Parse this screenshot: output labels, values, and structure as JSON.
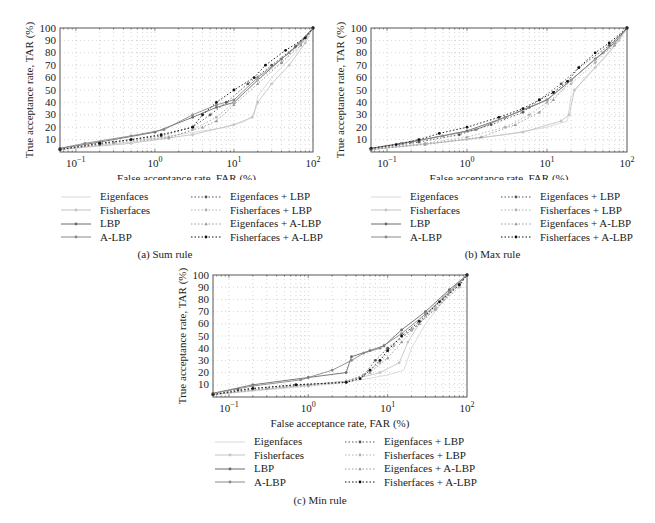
{
  "chart_data": [
    {
      "type": "line",
      "title": "(a) Sum rule",
      "xlabel": "False acceptance rate, FAR (%)",
      "ylabel": "True acceptance rate, TAR (%)",
      "xscale": "log",
      "xlim": [
        0.063,
        100
      ],
      "ylim": [
        0,
        100
      ],
      "xticks": [
        "10^-1",
        "10^0",
        "10^1",
        "10^2"
      ],
      "yticks": [
        10,
        20,
        30,
        40,
        50,
        60,
        70,
        80,
        90,
        100
      ],
      "grid": true,
      "legend_position": "below",
      "series": [
        {
          "name": "Eigenfaces",
          "x": [
            0.063,
            0.5,
            2,
            8,
            14,
            18,
            20,
            30,
            60,
            100
          ],
          "y": [
            2,
            8,
            14,
            20,
            25,
            30,
            45,
            60,
            80,
            100
          ]
        },
        {
          "name": "Fisherfaces",
          "x": [
            0.063,
            0.5,
            3,
            10,
            17,
            20,
            30,
            50,
            80,
            100
          ],
          "y": [
            2,
            7,
            14,
            22,
            28,
            40,
            55,
            70,
            88,
            100
          ]
        },
        {
          "name": "LBP",
          "x": [
            0.063,
            0.2,
            1,
            3,
            6,
            10,
            20,
            40,
            70,
            100
          ],
          "y": [
            3,
            8,
            16,
            28,
            36,
            40,
            58,
            75,
            88,
            100
          ]
        },
        {
          "name": "A-LBP",
          "x": [
            0.063,
            0.13,
            0.5,
            1.3,
            3,
            6,
            10,
            20,
            50,
            100
          ],
          "y": [
            3,
            7,
            13,
            18,
            30,
            38,
            42,
            60,
            80,
            100
          ]
        },
        {
          "name": "Eigenfaces + LBP",
          "x": [
            0.063,
            0.2,
            0.5,
            1.2,
            3,
            5,
            8,
            15,
            30,
            60,
            100
          ],
          "y": [
            2,
            6,
            10,
            13,
            20,
            30,
            40,
            55,
            70,
            85,
            100
          ]
        },
        {
          "name": "Fisherfaces + LBP",
          "x": [
            0.063,
            0.3,
            1.5,
            3,
            6,
            10,
            20,
            40,
            70,
            100
          ],
          "y": [
            2,
            7,
            11,
            18,
            28,
            40,
            58,
            72,
            88,
            100
          ]
        },
        {
          "name": "Eigenfaces + A-LBP",
          "x": [
            0.063,
            0.3,
            1.5,
            4,
            6,
            10,
            20,
            40,
            70,
            100
          ],
          "y": [
            2,
            8,
            12,
            20,
            25,
            38,
            55,
            72,
            86,
            100
          ]
        },
        {
          "name": "Fisherfaces + A-LBP",
          "x": [
            0.063,
            0.2,
            0.5,
            1.2,
            3,
            4,
            6,
            10,
            18,
            25,
            45,
            80,
            100
          ],
          "y": [
            2,
            7,
            10,
            14,
            20,
            30,
            40,
            50,
            60,
            70,
            82,
            92,
            100
          ]
        }
      ]
    },
    {
      "type": "line",
      "title": "(b) Max rule",
      "xlabel": "False acceptance rate, FAR (%)",
      "ylabel": "True acceptance rate, TAR (%)",
      "xscale": "log",
      "xlim": [
        0.063,
        100
      ],
      "ylim": [
        0,
        100
      ],
      "xticks": [
        "10^-1",
        "10^0",
        "10^1",
        "10^2"
      ],
      "yticks": [
        10,
        20,
        30,
        40,
        50,
        60,
        70,
        80,
        90,
        100
      ],
      "grid": true,
      "legend_position": "below",
      "series": [
        {
          "name": "Eigenfaces",
          "x": [
            0.063,
            0.5,
            3,
            10,
            18,
            20,
            30,
            60,
            100
          ],
          "y": [
            2,
            8,
            14,
            20,
            25,
            45,
            60,
            80,
            100
          ]
        },
        {
          "name": "Fisherfaces",
          "x": [
            0.063,
            1,
            5,
            15,
            19,
            22,
            40,
            80,
            100
          ],
          "y": [
            2,
            10,
            16,
            25,
            30,
            50,
            68,
            90,
            100
          ]
        },
        {
          "name": "LBP",
          "x": [
            0.063,
            0.2,
            1,
            3,
            6,
            10,
            20,
            40,
            70,
            100
          ],
          "y": [
            3,
            8,
            17,
            28,
            36,
            42,
            58,
            75,
            88,
            100
          ]
        },
        {
          "name": "A-LBP",
          "x": [
            0.063,
            0.15,
            0.5,
            1.3,
            3,
            6,
            10,
            20,
            50,
            100
          ],
          "y": [
            3,
            7,
            13,
            18,
            28,
            36,
            42,
            58,
            80,
            100
          ]
        },
        {
          "name": "Eigenfaces + LBP",
          "x": [
            0.063,
            0.25,
            0.8,
            2,
            5,
            8,
            15,
            25,
            60,
            100
          ],
          "y": [
            2,
            8,
            14,
            22,
            32,
            42,
            55,
            68,
            86,
            100
          ]
        },
        {
          "name": "Fisherfaces + LBP",
          "x": [
            0.063,
            0.3,
            1,
            3,
            6,
            10,
            20,
            40,
            70,
            100
          ],
          "y": [
            2,
            7,
            12,
            20,
            30,
            40,
            55,
            72,
            88,
            100
          ]
        },
        {
          "name": "Eigenfaces + A-LBP",
          "x": [
            0.063,
            0.3,
            1.5,
            4,
            8,
            12,
            20,
            40,
            70,
            100
          ],
          "y": [
            2,
            6,
            12,
            22,
            32,
            42,
            58,
            75,
            86,
            100
          ]
        },
        {
          "name": "Fisherfaces + A-LBP",
          "x": [
            0.063,
            0.13,
            0.25,
            0.45,
            1,
            2.5,
            5,
            8,
            12,
            18,
            25,
            40,
            60,
            100
          ],
          "y": [
            3,
            6,
            10,
            15,
            20,
            28,
            35,
            42,
            48,
            57,
            68,
            80,
            88,
            100
          ]
        }
      ]
    },
    {
      "type": "line",
      "title": "(c) Min rule",
      "xlabel": "False acceptance rate, FAR (%)",
      "ylabel": "True acceptance rate, TAR (%)",
      "xscale": "log",
      "xlim": [
        0.063,
        100
      ],
      "ylim": [
        0,
        100
      ],
      "xticks": [
        "10^-1",
        "10^0",
        "10^1",
        "10^2"
      ],
      "yticks": [
        10,
        20,
        30,
        40,
        50,
        60,
        70,
        80,
        90,
        100
      ],
      "grid": true,
      "legend_position": "below",
      "series": [
        {
          "name": "Eigenfaces",
          "x": [
            0.063,
            0.7,
            3,
            10,
            16,
            20,
            30,
            60,
            100
          ],
          "y": [
            2,
            8,
            12,
            18,
            22,
            40,
            60,
            85,
            100
          ]
        },
        {
          "name": "Fisherfaces",
          "x": [
            0.063,
            0.5,
            3,
            8,
            14,
            18,
            25,
            50,
            100
          ],
          "y": [
            2,
            8,
            13,
            20,
            28,
            45,
            60,
            82,
            100
          ]
        },
        {
          "name": "LBP",
          "x": [
            0.063,
            0.2,
            1,
            3,
            3.5,
            6,
            9,
            15,
            30,
            60,
            100
          ],
          "y": [
            3,
            10,
            16,
            20,
            33,
            38,
            42,
            55,
            70,
            88,
            100
          ]
        },
        {
          "name": "A-LBP",
          "x": [
            0.063,
            0.2,
            0.8,
            2,
            3.5,
            5,
            8,
            15,
            30,
            60,
            100
          ],
          "y": [
            3,
            9,
            14,
            22,
            30,
            36,
            40,
            52,
            68,
            86,
            100
          ]
        },
        {
          "name": "Eigenfaces + LBP",
          "x": [
            0.063,
            0.13,
            0.7,
            3,
            5,
            7,
            10,
            20,
            40,
            80,
            100
          ],
          "y": [
            2,
            6,
            10,
            12,
            18,
            30,
            40,
            55,
            72,
            92,
            100
          ]
        },
        {
          "name": "Fisherfaces + LBP",
          "x": [
            0.063,
            0.2,
            1,
            3,
            5,
            8,
            12,
            20,
            40,
            80,
            100
          ],
          "y": [
            2,
            6,
            9,
            12,
            18,
            28,
            42,
            55,
            72,
            90,
            100
          ]
        },
        {
          "name": "Eigenfaces + A-LBP",
          "x": [
            0.063,
            0.3,
            1,
            3,
            6,
            10,
            15,
            25,
            50,
            100
          ],
          "y": [
            2,
            7,
            10,
            13,
            20,
            32,
            45,
            60,
            80,
            100
          ]
        },
        {
          "name": "Fisherfaces + A-LBP",
          "x": [
            0.063,
            0.2,
            0.7,
            3,
            4.5,
            6,
            8,
            10,
            15,
            25,
            45,
            80,
            100
          ],
          "y": [
            2,
            7,
            10,
            12,
            15,
            22,
            30,
            38,
            50,
            62,
            78,
            92,
            100
          ]
        }
      ]
    }
  ],
  "legend": {
    "items": [
      {
        "label": "Eigenfaces",
        "color": "#d8d8d8",
        "dash": "",
        "marker": "none",
        "col": 0
      },
      {
        "label": "Fisherfaces",
        "color": "#c4c4c4",
        "dash": "",
        "marker": "dot",
        "col": 0
      },
      {
        "label": "LBP",
        "color": "#6a6a6a",
        "dash": "",
        "marker": "dot",
        "col": 0
      },
      {
        "label": "A-LBP",
        "color": "#8a8a8a",
        "dash": "",
        "marker": "dot",
        "col": 0
      },
      {
        "label": "Eigenfaces + LBP",
        "color": "#555555",
        "dash": "1.5,2",
        "marker": "dot",
        "col": 1
      },
      {
        "label": "Fisherfaces + LBP",
        "color": "#b0b0b0",
        "dash": "1.5,2",
        "marker": "dot",
        "col": 1
      },
      {
        "label": "Eigenfaces + A-LBP",
        "color": "#999999",
        "dash": "1.5,2",
        "marker": "tri",
        "col": 1
      },
      {
        "label": "Fisherfaces + A-LBP",
        "color": "#111111",
        "dash": "1.5,2",
        "marker": "dot",
        "col": 1
      }
    ]
  },
  "captions": {
    "a": "(a)  Sum rule",
    "b": "(b)  Max rule",
    "c": "(c)  Min rule"
  },
  "axis": {
    "xlabel": "False acceptance rate, FAR (%)",
    "ylabel": "True acceptance rate, TAR (%)"
  }
}
